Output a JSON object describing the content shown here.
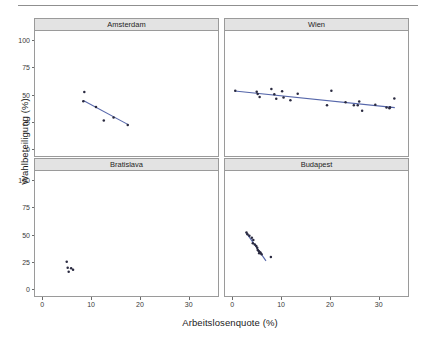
{
  "figure": {
    "has_top_rule": true,
    "background": "#ffffff",
    "point_color": "#2a2a40",
    "line_color": "#5566aa",
    "strip_fill": "#e3e3e3",
    "panel_border": "#9a9a9a"
  },
  "chart_data": {
    "type": "scatter",
    "title": "",
    "subtitle": "",
    "xlabel": "Arbeitslosenquote (%)",
    "ylabel": "Wahlbeteiligung (%)",
    "xlim": [
      -1.5,
      36
    ],
    "ylim": [
      -6,
      108
    ],
    "xticks": [
      0,
      10,
      20,
      30
    ],
    "xticklabels": [
      "0",
      "10",
      "20",
      "30"
    ],
    "yticks": [
      0,
      25,
      50,
      75,
      100
    ],
    "yticklabels": [
      "0",
      "25",
      "50",
      "75",
      "100"
    ],
    "grid": false,
    "legend": "none",
    "facet_layout": "2x2",
    "facets": [
      {
        "label": "Amsterdam",
        "row": 0,
        "col": 0,
        "points": [
          {
            "x": 8.6,
            "y": 52.3
          },
          {
            "x": 8.4,
            "y": 44.0
          },
          {
            "x": 11.0,
            "y": 38.7
          },
          {
            "x": 12.6,
            "y": 26.3
          },
          {
            "x": 14.6,
            "y": 29.1
          },
          {
            "x": 17.5,
            "y": 22.3
          }
        ],
        "fit_line": {
          "x0": 8.4,
          "y0": 44.6,
          "x1": 17.6,
          "y1": 22.6
        }
      },
      {
        "label": "Wien",
        "row": 0,
        "col": 1,
        "points": [
          {
            "x": 0.6,
            "y": 53.5
          },
          {
            "x": 5.0,
            "y": 52.6
          },
          {
            "x": 5.2,
            "y": 50.5
          },
          {
            "x": 5.6,
            "y": 47.8
          },
          {
            "x": 8.0,
            "y": 55.0
          },
          {
            "x": 8.6,
            "y": 50.4
          },
          {
            "x": 9.0,
            "y": 46.3
          },
          {
            "x": 10.2,
            "y": 53.0
          },
          {
            "x": 10.5,
            "y": 47.4
          },
          {
            "x": 11.9,
            "y": 44.9
          },
          {
            "x": 13.4,
            "y": 50.7
          },
          {
            "x": 19.4,
            "y": 40.2
          },
          {
            "x": 20.3,
            "y": 53.4
          },
          {
            "x": 23.2,
            "y": 43.1
          },
          {
            "x": 24.9,
            "y": 40.3
          },
          {
            "x": 25.7,
            "y": 40.2
          },
          {
            "x": 26.0,
            "y": 43.7
          },
          {
            "x": 26.6,
            "y": 35.3
          },
          {
            "x": 29.3,
            "y": 40.7
          },
          {
            "x": 31.6,
            "y": 38.2
          },
          {
            "x": 32.2,
            "y": 37.5
          },
          {
            "x": 32.3,
            "y": 38.5
          },
          {
            "x": 33.2,
            "y": 46.5
          }
        ],
        "fit_line": {
          "x0": 0.5,
          "y0": 53.3,
          "x1": 33.3,
          "y1": 38.1
        }
      },
      {
        "label": "Bratislava",
        "row": 1,
        "col": 0,
        "points": [
          {
            "x": 5.0,
            "y": 25.2
          },
          {
            "x": 5.2,
            "y": 19.8
          },
          {
            "x": 5.4,
            "y": 16.2
          },
          {
            "x": 5.9,
            "y": 19.4
          },
          {
            "x": 6.3,
            "y": 18.0
          }
        ],
        "fit_line": null
      },
      {
        "label": "Budapest",
        "row": 1,
        "col": 1,
        "points": [
          {
            "x": 2.9,
            "y": 51.8
          },
          {
            "x": 3.1,
            "y": 50.3
          },
          {
            "x": 3.5,
            "y": 49.0
          },
          {
            "x": 4.0,
            "y": 47.1
          },
          {
            "x": 4.3,
            "y": 45.1
          },
          {
            "x": 4.2,
            "y": 42.2
          },
          {
            "x": 4.6,
            "y": 41.0
          },
          {
            "x": 4.9,
            "y": 39.6
          },
          {
            "x": 5.1,
            "y": 37.9
          },
          {
            "x": 5.2,
            "y": 36.0
          },
          {
            "x": 5.4,
            "y": 35.0
          },
          {
            "x": 5.6,
            "y": 34.2
          },
          {
            "x": 5.5,
            "y": 33.0
          },
          {
            "x": 5.8,
            "y": 33.5
          },
          {
            "x": 6.0,
            "y": 32.1
          },
          {
            "x": 7.9,
            "y": 29.6
          }
        ],
        "fit_line": {
          "x0": 2.8,
          "y0": 52.0,
          "x1": 6.9,
          "y1": 26.0
        }
      }
    ]
  }
}
